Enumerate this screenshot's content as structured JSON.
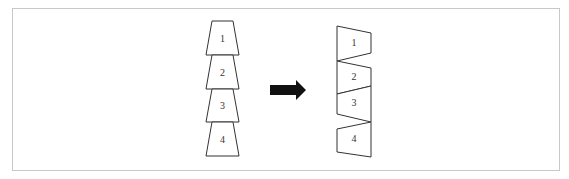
{
  "diagram": {
    "left_stack": {
      "labels": [
        "1",
        "2",
        "3",
        "4"
      ]
    },
    "arrow": {
      "icon": "right-arrow-icon",
      "color": "#111111"
    },
    "right_stack": {
      "labels": [
        "1",
        "2",
        "3",
        "4"
      ]
    },
    "colors": {
      "stroke": "#333333",
      "frame": "#c8c8c8",
      "background": "#ffffff"
    }
  }
}
